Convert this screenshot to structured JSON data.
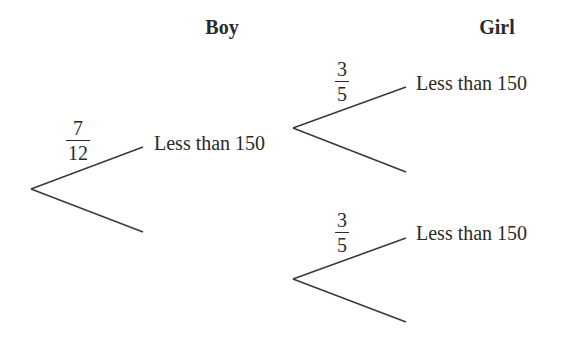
{
  "headers": {
    "boy": "Boy",
    "girl": "Girl"
  },
  "branches": {
    "boy_top": {
      "label": "Less than 150",
      "probability": {
        "numerator": "7",
        "denominator": "12"
      }
    },
    "girl_top_top": {
      "label": "Less than 150",
      "probability": {
        "numerator": "3",
        "denominator": "5"
      }
    },
    "girl_bottom_top": {
      "label": "Less than 150",
      "probability": {
        "numerator": "3",
        "denominator": "5"
      }
    }
  },
  "colors": {
    "line": "#3a3a3a",
    "text": "#2a2a2a",
    "background": "#ffffff"
  }
}
